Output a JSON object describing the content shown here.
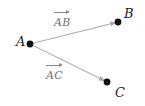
{
  "figure": {
    "background_color": "#ffffff",
    "width": 145,
    "height": 106,
    "point_color": "#111111",
    "ray_color": "#b0b0b0",
    "label_color": "#1a1a1a",
    "vector_label_color": "#6f6f6f"
  },
  "points": [
    {
      "name": "A",
      "label": "A",
      "x": 30,
      "y": 44,
      "label_x": 16,
      "label_y": 36,
      "radius": 3.4
    },
    {
      "name": "B",
      "label": "B",
      "x": 118,
      "y": 22,
      "label_x": 124,
      "label_y": 8,
      "radius": 3.4
    },
    {
      "name": "C",
      "label": "C",
      "x": 107,
      "y": 82,
      "label_x": 115,
      "label_y": 86,
      "radius": 3.4
    }
  ],
  "rays": [
    {
      "name": "AB",
      "from": "A",
      "to": "B",
      "x1": 30,
      "y1": 44,
      "x2": 118,
      "y2": 22,
      "arrowhead": true
    },
    {
      "name": "AC",
      "from": "A",
      "to": "C",
      "x1": 30,
      "y1": 44,
      "x2": 107,
      "y2": 82,
      "arrowhead": true
    }
  ],
  "vector_labels": [
    {
      "name": "AB",
      "text": "AB",
      "overarrow": true,
      "x": 54,
      "y": 10
    },
    {
      "name": "AC",
      "text": "AC",
      "overarrow": true,
      "x": 46,
      "y": 63
    }
  ]
}
